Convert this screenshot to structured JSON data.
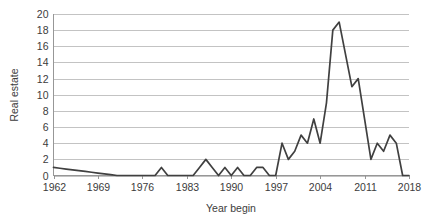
{
  "chart_data": {
    "type": "line",
    "title": "",
    "xlabel": "Year begin",
    "ylabel": "Real estate",
    "xlim": [
      1962,
      2018
    ],
    "ylim": [
      0,
      20
    ],
    "grid": true,
    "legend": false,
    "y_ticks": [
      0,
      2,
      4,
      6,
      8,
      10,
      12,
      14,
      16,
      18,
      20
    ],
    "y_tick_labels": [
      "0",
      "2",
      "4",
      "6",
      "8",
      "10",
      "12",
      "14",
      "16",
      "18",
      "20"
    ],
    "x_ticks": [
      1962,
      1969,
      1976,
      1983,
      1990,
      1997,
      2004,
      2011,
      2018
    ],
    "x_tick_labels": [
      "1962",
      "1969",
      "1976",
      "1983",
      "1990",
      "1997",
      "2004",
      "2011",
      "2018"
    ],
    "series": [
      {
        "name": "Real estate",
        "color": "#404040",
        "x": [
          1962,
          1963,
          1964,
          1965,
          1966,
          1967,
          1968,
          1969,
          1970,
          1971,
          1972,
          1973,
          1974,
          1975,
          1976,
          1977,
          1978,
          1979,
          1980,
          1981,
          1982,
          1983,
          1984,
          1985,
          1986,
          1987,
          1988,
          1989,
          1990,
          1991,
          1992,
          1993,
          1994,
          1995,
          1996,
          1997,
          1998,
          1999,
          2000,
          2001,
          2002,
          2003,
          2004,
          2005,
          2006,
          2007,
          2008,
          2009,
          2010,
          2011,
          2012,
          2013,
          2014,
          2015,
          2016,
          2017,
          2018
        ],
        "values": [
          1,
          0.9,
          0.8,
          0.7,
          0.6,
          0.5,
          0.4,
          0.3,
          0.2,
          0.1,
          0,
          0,
          0,
          0,
          0,
          0,
          0,
          1,
          0,
          0,
          0,
          0,
          0,
          1,
          2,
          1,
          0,
          1,
          0,
          1,
          0,
          0,
          1,
          1,
          0,
          0,
          4,
          2,
          3,
          5,
          4,
          7,
          4,
          9,
          18,
          19,
          15,
          11,
          12,
          7,
          2,
          4,
          3,
          5,
          4,
          0,
          0
        ]
      }
    ]
  },
  "axis": {
    "y_title": "Real estate",
    "x_title": "Year begin"
  },
  "colors": {
    "line": "#404040",
    "grid": "#a9a9a9",
    "axis": "#8c8c8c",
    "text": "#3c3c3c",
    "background": "#ffffff"
  }
}
